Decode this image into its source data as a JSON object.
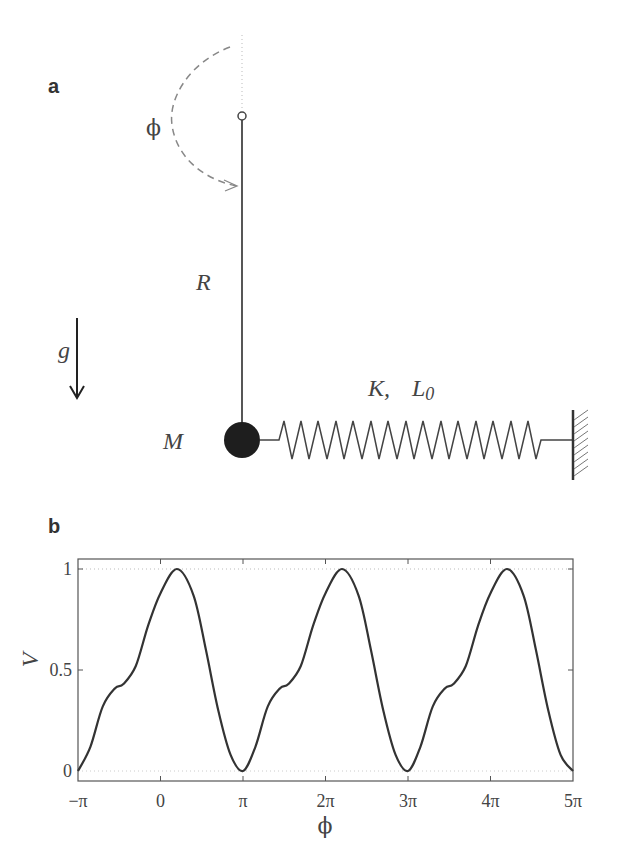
{
  "panel_a": {
    "label": "a",
    "angle_label": "ϕ",
    "rod_label": "R",
    "gravity_label": "g",
    "mass_label": "M",
    "spring_label_K": "K,",
    "spring_label_L": "L",
    "spring_label_L_sub": "0"
  },
  "panel_b": {
    "label": "b"
  },
  "chart_data": {
    "type": "line",
    "title": "",
    "xlabel": "ϕ",
    "ylabel": "V",
    "x_tick_labels": [
      "−π",
      "0",
      "π",
      "2π",
      "3π",
      "4π",
      "5π"
    ],
    "y_tick_labels": [
      "0",
      "0.5",
      "1"
    ],
    "xlim_over_pi": [
      -1,
      5
    ],
    "ylim": [
      -0.02,
      1.02
    ],
    "grid": false,
    "reference_lines": [
      0,
      1
    ],
    "period_over_pi": 2,
    "series": [
      {
        "name": "V(ϕ)",
        "x_over_pi": [
          -1,
          -0.85,
          -0.7,
          -0.55,
          -0.45,
          -0.3,
          -0.15,
          0,
          0.2,
          0.4,
          0.55,
          0.7,
          0.85,
          1
        ],
        "values": [
          0,
          0.12,
          0.32,
          0.41,
          0.43,
          0.52,
          0.72,
          0.88,
          1.0,
          0.87,
          0.6,
          0.3,
          0.08,
          0
        ]
      }
    ]
  }
}
